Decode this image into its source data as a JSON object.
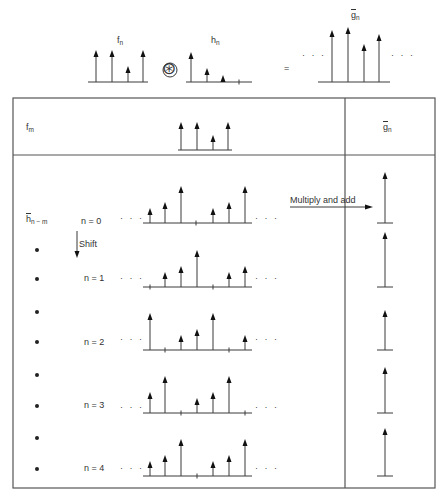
{
  "top": {
    "f_label": "f",
    "f_sub": "n",
    "h_label": "h",
    "h_sub": "n",
    "g_label": "g",
    "g_sub": "n",
    "operator": "⊛",
    "equals": "=",
    "ellipsis": "· · ·",
    "f": {
      "baseline_y": 82,
      "x0": 88,
      "x1": 148,
      "stems": [
        {
          "x": 96,
          "top": 50
        },
        {
          "x": 112,
          "top": 50
        },
        {
          "x": 128,
          "top": 66
        },
        {
          "x": 143,
          "top": 50
        }
      ]
    },
    "h": {
      "baseline_y": 82,
      "x0": 186,
      "x1": 252,
      "stems": [
        {
          "x": 191,
          "top": 52
        },
        {
          "x": 207,
          "top": 68
        },
        {
          "x": 223,
          "top": 75
        }
      ],
      "ticks": [
        239
      ]
    },
    "g": {
      "baseline_y": 82,
      "x0": 318,
      "x1": 390,
      "stems": [
        {
          "x": 332,
          "top": 30
        },
        {
          "x": 348,
          "top": 27
        },
        {
          "x": 364,
          "top": 44
        },
        {
          "x": 379,
          "top": 34
        }
      ]
    }
  },
  "table": {
    "header": {
      "left_label": "f",
      "left_sub": "m",
      "right_label": "g",
      "right_sub": "n",
      "f": {
        "baseline_y": 150,
        "x0": 178,
        "x1": 232,
        "stems": [
          {
            "x": 181,
            "top": 122
          },
          {
            "x": 197,
            "top": 122
          },
          {
            "x": 213,
            "top": 135
          },
          {
            "x": 228,
            "top": 122
          }
        ]
      }
    },
    "row_label": "h",
    "row_sub": "n − m",
    "shift_label": "Shift",
    "multiply_label": "Multiply and add",
    "rows": [
      {
        "n_label": "n = 0",
        "baseline_y": 223,
        "stems": [
          {
            "x": 150,
            "h": 8
          },
          {
            "x": 165,
            "h": 14
          },
          {
            "x": 181,
            "h": 30
          },
          {
            "x": 213,
            "h": 8
          },
          {
            "x": 229,
            "h": 14
          },
          {
            "x": 245,
            "h": 30
          }
        ],
        "ticks": [
          196
        ],
        "g_top": 172
      },
      {
        "n_label": "n = 1",
        "baseline_y": 287,
        "stems": [
          {
            "x": 165,
            "h": 8
          },
          {
            "x": 181,
            "h": 14
          },
          {
            "x": 197,
            "h": 30
          },
          {
            "x": 229,
            "h": 8
          },
          {
            "x": 245,
            "h": 14
          }
        ],
        "ticks": [
          150,
          213
        ],
        "g_top": 232
      },
      {
        "n_label": "n = 2",
        "baseline_y": 350,
        "stems": [
          {
            "x": 150,
            "h": 30
          },
          {
            "x": 181,
            "h": 8
          },
          {
            "x": 197,
            "h": 14
          },
          {
            "x": 213,
            "h": 30
          },
          {
            "x": 245,
            "h": 8
          }
        ],
        "ticks": [
          165,
          229
        ],
        "g_top": 310
      },
      {
        "n_label": "n = 3",
        "baseline_y": 413,
        "stems": [
          {
            "x": 150,
            "h": 14
          },
          {
            "x": 165,
            "h": 30
          },
          {
            "x": 197,
            "h": 8
          },
          {
            "x": 213,
            "h": 14
          },
          {
            "x": 229,
            "h": 30
          }
        ],
        "ticks": [
          181,
          245
        ],
        "g_top": 367
      },
      {
        "n_label": "n = 4",
        "baseline_y": 476,
        "stems": [
          {
            "x": 150,
            "h": 8
          },
          {
            "x": 165,
            "h": 14
          },
          {
            "x": 181,
            "h": 30
          },
          {
            "x": 213,
            "h": 8
          },
          {
            "x": 229,
            "h": 14
          },
          {
            "x": 245,
            "h": 30
          }
        ],
        "ticks": [
          197
        ],
        "g_top": 428
      }
    ]
  },
  "colors": {
    "line": "#3a3a3a",
    "border": "#555555",
    "text": "#333333"
  }
}
